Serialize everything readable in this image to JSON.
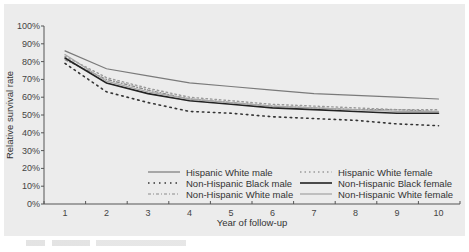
{
  "chart_data": {
    "type": "line",
    "title": "",
    "xlabel": "Year of follow-up",
    "ylabel": "Relative survival rate",
    "x": [
      1,
      2,
      3,
      4,
      5,
      6,
      7,
      8,
      9,
      10
    ],
    "x_tick_labels": [
      "1",
      "2",
      "3",
      "4",
      "5",
      "6",
      "7",
      "8",
      "9",
      "10"
    ],
    "y_tick_labels": [
      "0%",
      "10%",
      "20%",
      "30%",
      "40%",
      "50%",
      "60%",
      "70%",
      "80%",
      "90%",
      "100%"
    ],
    "ylim": [
      0,
      100
    ],
    "xlim": [
      0.5,
      10.5
    ],
    "grid": false,
    "legend_position": "lower center (inside plot)",
    "series": [
      {
        "name": "Hispanic White male",
        "style": "solid",
        "color": "#7a7a7a",
        "values": [
          86,
          76,
          72,
          68,
          66,
          64,
          62,
          61,
          60,
          59
        ]
      },
      {
        "name": "Non-Hispanic Black male",
        "style": "dotted",
        "color": "#333333",
        "values": [
          79,
          63,
          57,
          52,
          51,
          49,
          48,
          47,
          45,
          44
        ]
      },
      {
        "name": "Non-Hispanic White male",
        "style": "dash-dot",
        "color": "#8a8a8a",
        "values": [
          81,
          70,
          64,
          59,
          57,
          55,
          54,
          53,
          53,
          52
        ]
      },
      {
        "name": "Hispanic White female",
        "style": "dotted-light",
        "color": "#9a9a9a",
        "values": [
          83,
          71,
          65,
          60,
          58,
          56,
          55,
          54,
          53,
          53
        ]
      },
      {
        "name": "Non-Hispanic Black female",
        "style": "solid-bold",
        "color": "#222222",
        "values": [
          82,
          68,
          62,
          58,
          56,
          54,
          53,
          52,
          51,
          51
        ]
      },
      {
        "name": "Non-Hispanic White female",
        "style": "solid-light",
        "color": "#a8a8a8",
        "values": [
          84,
          69,
          63,
          59,
          57,
          55,
          54,
          53,
          52,
          52
        ]
      }
    ]
  },
  "legend": {
    "left": [
      "Hispanic White male",
      "Non-Hispanic Black male",
      "Non-Hispanic White male"
    ],
    "right": [
      "Hispanic White female",
      "Non-Hispanic Black female",
      "Non-Hispanic White female"
    ]
  },
  "axes": {
    "x_title": "Year of follow-up",
    "y_title": "Relative survival rate"
  }
}
